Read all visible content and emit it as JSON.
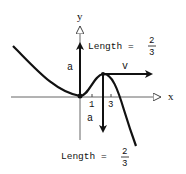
{
  "diagram": {
    "axes": {
      "x_label": "x",
      "y_label": "y",
      "ticks": [
        {
          "label": "1",
          "x": 92
        },
        {
          "label": "3",
          "x": 111
        }
      ]
    },
    "vectors": [
      {
        "name": "acceleration-at-origin",
        "label": "a",
        "direction": "up"
      },
      {
        "name": "velocity-at-peak",
        "label": "v",
        "direction": "right"
      },
      {
        "name": "acceleration-at-peak",
        "label": "a",
        "direction": "down"
      }
    ],
    "annotations": {
      "top": {
        "prefix": "Length =",
        "numerator": "2",
        "denominator": "3"
      },
      "bottom": {
        "prefix": "Length =",
        "numerator": "2",
        "denominator": "3"
      }
    },
    "colors": {
      "curve": "#111111",
      "axis": "#555555",
      "background": "#ffffff"
    }
  }
}
